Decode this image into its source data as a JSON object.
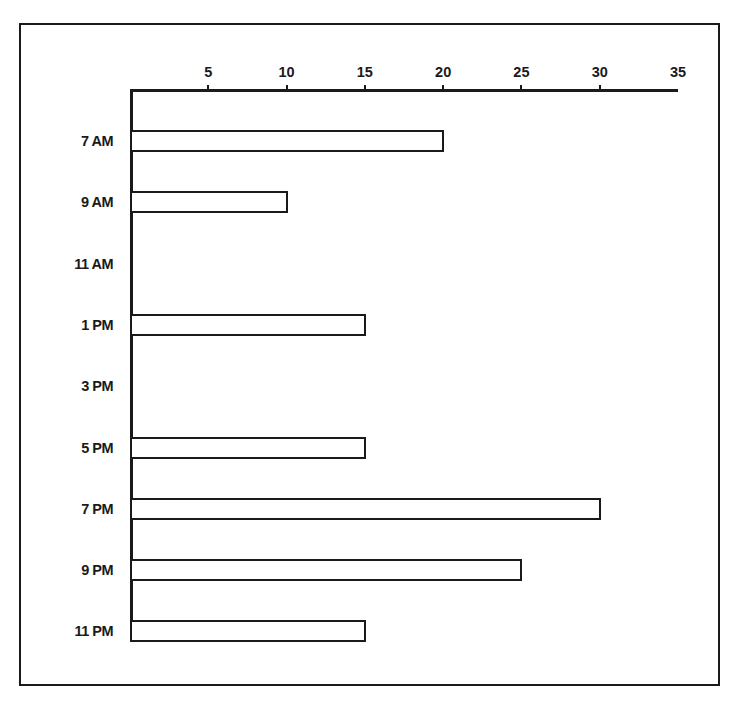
{
  "chart_data": {
    "type": "bar",
    "orientation": "horizontal",
    "title": "",
    "xlabel": "",
    "ylabel": "",
    "categories": [
      "7 AM",
      "9 AM",
      "11 AM",
      "1 PM",
      "3 PM",
      "5 PM",
      "7 PM",
      "9 PM",
      "11 PM"
    ],
    "values": [
      20,
      10,
      0,
      15,
      0,
      15,
      30,
      25,
      15
    ],
    "xlim": [
      0,
      35
    ],
    "xticks": [
      5,
      10,
      15,
      20,
      25,
      30,
      35
    ],
    "xtick_labels": [
      "5",
      "10",
      "15",
      "20",
      "25",
      "30",
      "35"
    ],
    "x_axis_position": "top",
    "grid": false,
    "legend": null,
    "bar_fill": "#ffffff",
    "bar_edge": "#1a1a1a"
  }
}
